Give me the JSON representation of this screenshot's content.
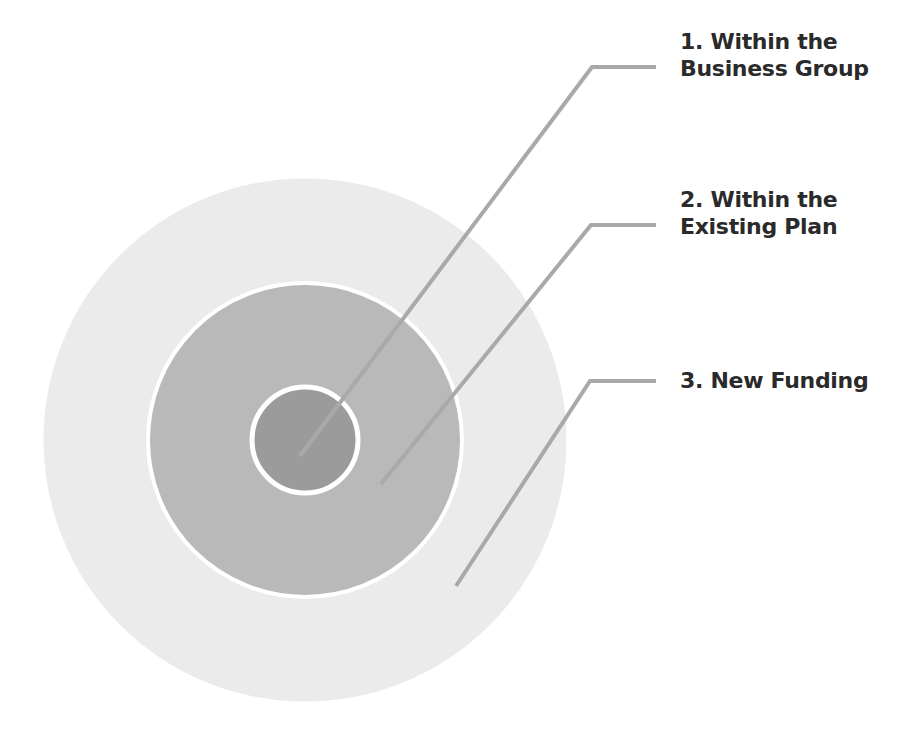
{
  "diagram": {
    "type": "concentric-circles",
    "colors": {
      "background": "#ffffff",
      "outer_ring": "#ebebeb",
      "middle_ring": "#b9b9b9",
      "inner_core": "#9b9b9b",
      "ring_border": "#ffffff",
      "leader_line": "#a9a9a9",
      "label_text": "#2a2a2a"
    },
    "rings": [
      {
        "id": "inner",
        "level": 1,
        "cx": 305,
        "cy": 440,
        "r": 53
      },
      {
        "id": "middle",
        "level": 2,
        "cx": 305,
        "cy": 440,
        "r": 157
      },
      {
        "id": "outer",
        "level": 3,
        "cx": 305,
        "cy": 440,
        "r": 263
      }
    ],
    "labels": [
      {
        "number": "1.",
        "lines": [
          "1. Within the",
          "Business Group"
        ],
        "leader": {
          "from": [
            300,
            456
          ],
          "elbow": [
            592,
            67
          ],
          "to": [
            656,
            67
          ]
        }
      },
      {
        "number": "2.",
        "lines": [
          "2. Within the",
          "Existing Plan"
        ],
        "leader": {
          "from": [
            381,
            484
          ],
          "elbow": [
            591,
            225
          ],
          "to": [
            656,
            225
          ]
        }
      },
      {
        "number": "3.",
        "lines": [
          "3. New Funding"
        ],
        "leader": {
          "from": [
            456,
            586
          ],
          "elbow": [
            590,
            381
          ],
          "to": [
            656,
            381
          ]
        }
      }
    ]
  }
}
